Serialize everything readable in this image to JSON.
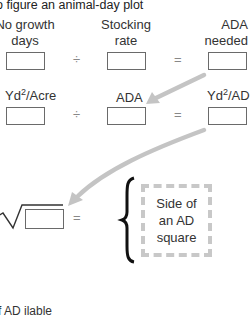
{
  "title": "o figure an animal-day plot",
  "row1": {
    "labels": [
      "No growth days",
      "Stocking rate",
      "ADA needed"
    ],
    "label_lines": [
      [
        "No growth",
        "days"
      ],
      [
        "Stocking",
        "rate"
      ],
      [
        "ADA",
        "needed"
      ]
    ],
    "operators": [
      "÷",
      "="
    ]
  },
  "row2": {
    "labels": [
      {
        "base": "Yd",
        "sup": "2",
        "rest": "/Acre"
      },
      {
        "base": "ADA",
        "sup": "",
        "rest": ""
      },
      {
        "base": "Yd",
        "sup": "2",
        "rest": "/AD"
      }
    ],
    "operators": [
      "÷",
      "="
    ]
  },
  "row3": {
    "sqrt_symbol": "√",
    "equals": "=",
    "result_lines": [
      "Side of",
      "an AD",
      "square"
    ],
    "brace": "{"
  },
  "bottom_text": "f        AD      ilable",
  "colors": {
    "arrow": "#c4c4c4",
    "box_border": "#6a6a6a",
    "dashed": "#c8c8c8"
  }
}
